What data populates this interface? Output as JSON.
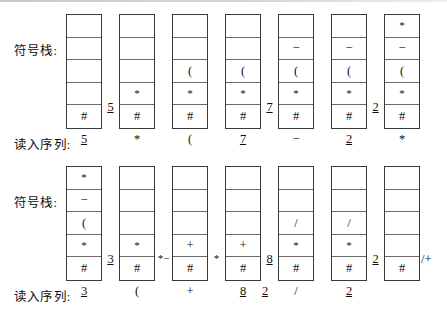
{
  "figure": {
    "row_labels": {
      "stack": "符号栈:",
      "input": "读入序列:"
    }
  },
  "rows": [
    {
      "name": "row-1",
      "label_stack": "符号栈:",
      "label_input": "读入序列:",
      "stacks": [
        {
          "cells": [
            "",
            "",
            "",
            "",
            "#"
          ],
          "token": "5",
          "token_underline": true,
          "note_after": "5",
          "note_underline": true
        },
        {
          "cells": [
            "",
            "",
            "",
            "*",
            "#"
          ],
          "token": "*",
          "token_underline": false,
          "note_after": "",
          "note_underline": false
        },
        {
          "cells": [
            "",
            "",
            "(",
            "*",
            "#"
          ],
          "token": "(",
          "token_underline": false,
          "note_after": "",
          "note_underline": false
        },
        {
          "cells": [
            "",
            "",
            "(",
            "*",
            "#"
          ],
          "token": "7",
          "token_underline": true,
          "note_after": "7",
          "note_underline": true
        },
        {
          "cells": [
            "",
            "−",
            "(",
            "*",
            "#"
          ],
          "token": "−",
          "token_underline": false,
          "note_after": "",
          "note_underline": false
        },
        {
          "cells": [
            "",
            "−",
            "(",
            "*",
            "#"
          ],
          "token": "2",
          "token_underline": true,
          "note_after": "2",
          "note_underline": true
        },
        {
          "cells": [
            "*",
            "−",
            "(",
            "*",
            "#"
          ],
          "token": "*",
          "token_underline": false,
          "note_after": "",
          "note_underline": false
        }
      ]
    },
    {
      "name": "row-2",
      "label_stack": "符号栈:",
      "label_input": "读入序列:",
      "stacks": [
        {
          "cells": [
            "*",
            "−",
            "(",
            "*",
            "#"
          ],
          "token": "3",
          "token_underline": true,
          "note_after": "3",
          "note_underline": true
        },
        {
          "cells": [
            "",
            "",
            "",
            "*",
            "#"
          ],
          "token": "(",
          "token_underline": false,
          "note_after": "*−",
          "note_underline": false
        },
        {
          "cells": [
            "",
            "",
            "",
            "+",
            "#"
          ],
          "token": "+",
          "token_underline": false,
          "note_after": "*",
          "note_underline": false
        },
        {
          "cells": [
            "",
            "",
            "",
            "+",
            "#"
          ],
          "token": "8",
          "token_underline": true,
          "note_after": "8",
          "note_underline": true
        },
        {
          "cells": [
            "",
            "",
            "/",
            "*",
            "#"
          ],
          "token": "/",
          "token_underline": false,
          "note_before": "2",
          "note_before_underline": true,
          "note_after": "",
          "note_underline": false
        },
        {
          "cells": [
            "",
            "",
            "/",
            "*",
            "#"
          ],
          "token": "2",
          "token_underline": true,
          "note_after": "2",
          "note_underline": true
        },
        {
          "cells": [
            "",
            "",
            "",
            "",
            "#"
          ],
          "token": "",
          "token_underline": false,
          "note_after": "/+",
          "note_underline": false
        }
      ]
    }
  ],
  "geometry": {
    "stack_x": [
      66,
      119,
      172,
      225,
      278,
      331,
      384
    ],
    "stack_width": 36,
    "cell_height": 22.6
  }
}
